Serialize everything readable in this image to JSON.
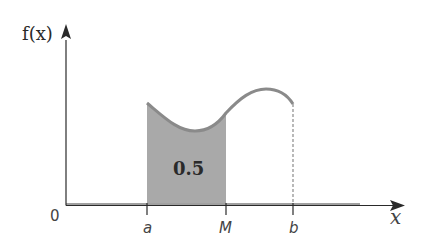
{
  "diagram": {
    "y_axis_label": "f(x)",
    "x_axis_label": "x",
    "origin_label": "0",
    "ticks": [
      {
        "label": "a",
        "x": 147
      },
      {
        "label": "M",
        "x": 226
      },
      {
        "label": "b",
        "x": 293
      }
    ],
    "shaded_area_label": "0.5",
    "colors": {
      "axis": "#2a2a2a",
      "curve": "#8a8a8a",
      "shade": "#a9a9a9",
      "baseline": "#9a9a9a"
    }
  }
}
